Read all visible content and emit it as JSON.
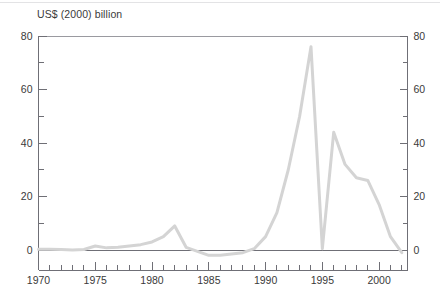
{
  "chart_data": {
    "type": "line",
    "title": "US$ (2000) billion",
    "xlabel": "",
    "ylabel": "US$ (2000) billion",
    "xlim": [
      1970,
      2002.5
    ],
    "ylim": [
      -3,
      80
    ],
    "grid": false,
    "legend": null,
    "series_color": "#d4d4d4",
    "axis_color": "#6f6f76",
    "x_major_ticks": [
      1970,
      1975,
      1980,
      1985,
      1990,
      1995,
      2000
    ],
    "x_major_tick_labels": [
      "1970",
      "1975",
      "1980",
      "1985",
      "1990",
      "1995",
      "2000"
    ],
    "x_minor_tick_step": 1,
    "y_major_ticks": [
      0,
      20,
      40,
      60,
      80
    ],
    "y_major_tick_labels": [
      "0",
      "20",
      "40",
      "60",
      "80"
    ],
    "y_minor_ticks": [
      10,
      30,
      50,
      70
    ],
    "y_axis_both_sides": true,
    "series": [
      {
        "name": "net flow",
        "x": [
          1970,
          1971,
          1972,
          1973,
          1974,
          1975,
          1976,
          1977,
          1978,
          1979,
          1980,
          1981,
          1982,
          1983,
          1984,
          1985,
          1986,
          1987,
          1988,
          1989,
          1990,
          1991,
          1992,
          1993,
          1994,
          1995,
          1996,
          1997,
          1998,
          1999,
          2000,
          2001,
          2002
        ],
        "values": [
          0.3,
          0.3,
          0.2,
          0.0,
          0.2,
          1.5,
          0.8,
          1.0,
          1.5,
          2.0,
          3.0,
          5.0,
          9.0,
          1.0,
          -0.5,
          -2.0,
          -2.0,
          -1.5,
          -1.0,
          0.5,
          5.0,
          14.0,
          30.0,
          50.0,
          76.0,
          0.5,
          44.0,
          32.0,
          27.0,
          26.0,
          17.0,
          5.0,
          -1.0
        ]
      }
    ]
  }
}
